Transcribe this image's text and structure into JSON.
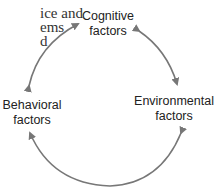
{
  "clipped_text": {
    "lines": [
      "ice and",
      "ems",
      "d"
    ]
  },
  "diagram": {
    "nodes": [
      {
        "id": "cognitive",
        "line1": "Cognitive",
        "line2": "factors"
      },
      {
        "id": "environmental",
        "line1": "Environmental",
        "line2": "factors"
      },
      {
        "id": "behavioral",
        "line1": "Behavioral",
        "line2": "factors"
      }
    ],
    "edges": [
      {
        "from": "cognitive",
        "to": "environmental",
        "bidirectional": true
      },
      {
        "from": "environmental",
        "to": "behavioral",
        "bidirectional": true
      },
      {
        "from": "behavioral",
        "to": "cognitive",
        "bidirectional": true
      }
    ],
    "arrow_color": "#777777"
  }
}
